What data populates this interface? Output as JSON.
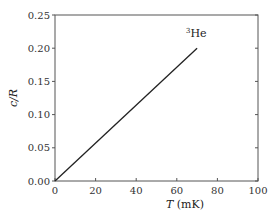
{
  "chart_data": {
    "type": "line",
    "title": "",
    "annotation": {
      "sup": "3",
      "text": "He"
    },
    "xlabel": "T (mK)",
    "xlabel_italic": "T",
    "xlabel_unit": " (mK)",
    "ylabel": "c/R",
    "xlim": [
      0,
      100
    ],
    "ylim": [
      0,
      0.25
    ],
    "xticks": [
      0,
      20,
      40,
      60,
      80,
      100
    ],
    "xtick_labels": [
      "0",
      "20",
      "40",
      "60",
      "80",
      "100"
    ],
    "yticks": [
      0,
      0.05,
      0.1,
      0.15,
      0.2,
      0.25
    ],
    "ytick_labels": [
      "0.00",
      "0.05",
      "0.10",
      "0.15",
      "0.20",
      "0.25"
    ],
    "grid": false,
    "legend": null,
    "series": [
      {
        "name": "3He",
        "x": [
          0,
          70
        ],
        "y": [
          0,
          0.2
        ],
        "color": "#222222"
      }
    ]
  }
}
